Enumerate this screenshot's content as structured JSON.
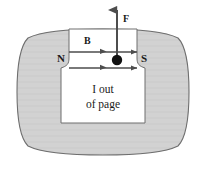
{
  "figure": {
    "labels": {
      "north_pole": "N",
      "south_pole": "S",
      "field_vector": "B",
      "force_vector": "F",
      "current_line1": "I out",
      "current_line2": "of page"
    },
    "colors": {
      "magnet_fill": "#d2d2d2",
      "magnet_stroke": "#6e6e6e",
      "cavity_fill": "#ffffff",
      "arrow": "#4d4d4d",
      "wire_dot": "#111111",
      "text": "#1a1a1a"
    },
    "elements": {
      "magnet_body": "horseshoe-magnet-body",
      "cavity": "magnet-cavity",
      "wire_dot": "current-carrying-wire-dot",
      "field_line_upper": "magnetic-field-line-upper",
      "field_line_lower": "magnetic-field-line-lower",
      "force_arrow": "force-arrow-up"
    }
  }
}
